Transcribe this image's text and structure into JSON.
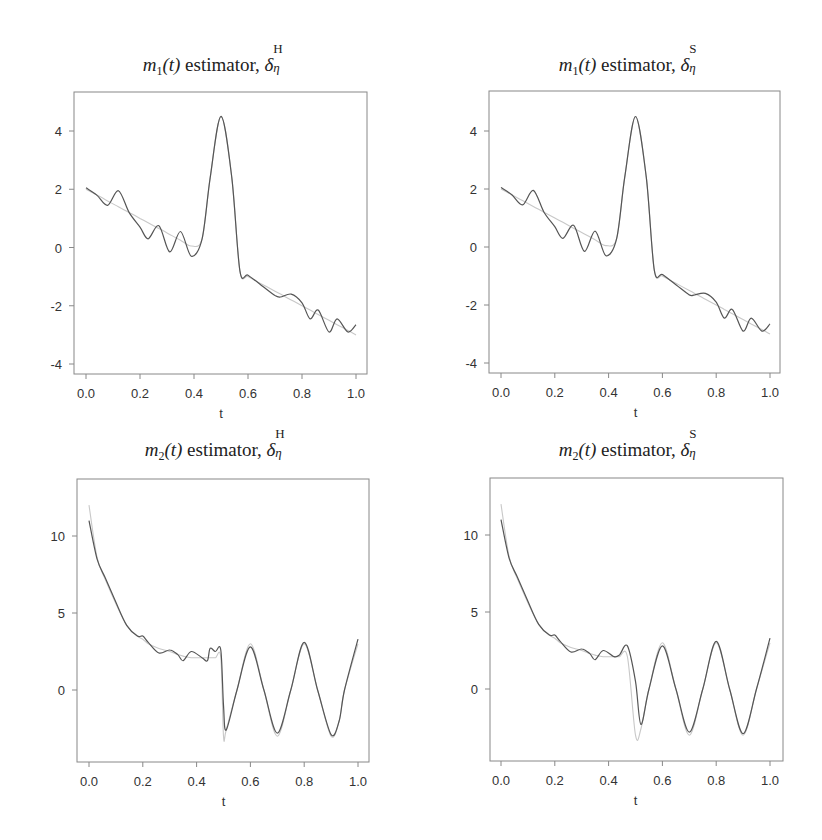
{
  "figure": {
    "panels": [
      {
        "id": "m1-H",
        "title_fn": "m",
        "title_sub": "1",
        "title_arg": "(t)",
        "title_text": " estimator, ",
        "title_delta": "δ",
        "title_sup": "H",
        "title_eta": "η",
        "xlabel": "t",
        "xticks": [
          "0.0",
          "0.2",
          "0.4",
          "0.6",
          "0.8",
          "1.0"
        ],
        "yticks": [
          "4",
          "2",
          "0",
          "-2",
          "-4"
        ]
      },
      {
        "id": "m1-S",
        "title_fn": "m",
        "title_sub": "1",
        "title_arg": "(t)",
        "title_text": " estimator, ",
        "title_delta": "δ",
        "title_sup": "S",
        "title_eta": "η",
        "xlabel": "t",
        "xticks": [
          "0.0",
          "0.2",
          "0.4",
          "0.6",
          "0.8",
          "1.0"
        ],
        "yticks": [
          "4",
          "2",
          "0",
          "-2",
          "-4"
        ]
      },
      {
        "id": "m2-H",
        "title_fn": "m",
        "title_sub": "2",
        "title_arg": "(t)",
        "title_text": " estimator, ",
        "title_delta": "δ",
        "title_sup": "H",
        "title_eta": "η",
        "xlabel": "t",
        "xticks": [
          "0.0",
          "0.2",
          "0.4",
          "0.6",
          "0.8",
          "1.0"
        ],
        "yticks": [
          "10",
          "5",
          "0"
        ]
      },
      {
        "id": "m2-S",
        "title_fn": "m",
        "title_sub": "2",
        "title_arg": "(t)",
        "title_text": " estimator, ",
        "title_delta": "δ",
        "title_sup": "S",
        "title_eta": "η",
        "xlabel": "t",
        "xticks": [
          "0.0",
          "0.2",
          "0.4",
          "0.6",
          "0.8",
          "1.0"
        ],
        "yticks": [
          "10",
          "5",
          "0"
        ]
      }
    ],
    "colors": {
      "estimate": "#555555",
      "truth": "#c8c8c8",
      "axis": "#888888"
    }
  },
  "chart_data": [
    {
      "type": "line",
      "title": "m1(t) estimator, δη^H",
      "xlabel": "t",
      "ylabel": "",
      "xlim": [
        0.0,
        1.0
      ],
      "ylim": [
        -4.3,
        5.3
      ],
      "x": [
        0.0,
        0.04,
        0.08,
        0.12,
        0.16,
        0.2,
        0.23,
        0.27,
        0.31,
        0.35,
        0.39,
        0.43,
        0.46,
        0.5,
        0.54,
        0.57,
        0.6,
        0.65,
        0.7,
        0.72,
        0.76,
        0.8,
        0.83,
        0.86,
        0.9,
        0.93,
        0.97,
        1.0
      ],
      "series": [
        {
          "name": "estimate",
          "values": [
            2.05,
            1.8,
            1.45,
            1.95,
            1.2,
            0.7,
            0.3,
            0.75,
            -0.15,
            0.55,
            -0.3,
            0.3,
            2.4,
            4.5,
            2.4,
            -0.8,
            -0.95,
            -1.3,
            -1.65,
            -1.7,
            -1.6,
            -1.9,
            -2.45,
            -2.15,
            -2.9,
            -2.45,
            -2.9,
            -2.65
          ]
        },
        {
          "name": "true",
          "values": [
            2.0,
            1.8,
            1.6,
            1.4,
            1.2,
            1.0,
            0.85,
            0.65,
            0.45,
            0.25,
            0.05,
            0.3,
            2.4,
            4.5,
            2.4,
            -0.8,
            -1.0,
            -1.25,
            -1.5,
            -1.6,
            -1.8,
            -2.0,
            -2.15,
            -2.3,
            -2.5,
            -2.65,
            -2.85,
            -3.0
          ]
        }
      ]
    },
    {
      "type": "line",
      "title": "m1(t) estimator, δη^S",
      "xlabel": "t",
      "ylabel": "",
      "xlim": [
        0.0,
        1.0
      ],
      "ylim": [
        -4.3,
        5.3
      ],
      "x": [
        0.0,
        0.04,
        0.08,
        0.12,
        0.16,
        0.2,
        0.23,
        0.27,
        0.31,
        0.35,
        0.39,
        0.43,
        0.46,
        0.5,
        0.54,
        0.57,
        0.6,
        0.65,
        0.7,
        0.72,
        0.76,
        0.8,
        0.83,
        0.86,
        0.9,
        0.93,
        0.97,
        1.0
      ],
      "series": [
        {
          "name": "estimate",
          "values": [
            2.05,
            1.8,
            1.45,
            1.95,
            1.2,
            0.7,
            0.3,
            0.75,
            -0.15,
            0.55,
            -0.3,
            0.3,
            2.4,
            4.5,
            2.4,
            -0.8,
            -0.95,
            -1.3,
            -1.65,
            -1.65,
            -1.6,
            -1.9,
            -2.45,
            -2.15,
            -2.9,
            -2.45,
            -2.9,
            -2.65
          ]
        },
        {
          "name": "true",
          "values": [
            2.0,
            1.8,
            1.6,
            1.4,
            1.2,
            1.0,
            0.85,
            0.65,
            0.45,
            0.25,
            0.05,
            0.3,
            2.4,
            4.5,
            2.4,
            -0.8,
            -1.0,
            -1.25,
            -1.5,
            -1.6,
            -1.8,
            -2.0,
            -2.15,
            -2.3,
            -2.5,
            -2.65,
            -2.85,
            -3.0
          ]
        }
      ]
    },
    {
      "type": "line",
      "title": "m2(t) estimator, δη^H",
      "xlabel": "t",
      "ylabel": "",
      "xlim": [
        0.0,
        1.0
      ],
      "ylim": [
        -4.7,
        13.7
      ],
      "x": [
        0.0,
        0.03,
        0.06,
        0.1,
        0.14,
        0.18,
        0.2,
        0.22,
        0.26,
        0.3,
        0.33,
        0.35,
        0.38,
        0.42,
        0.44,
        0.45,
        0.47,
        0.49,
        0.5,
        0.51,
        0.55,
        0.6,
        0.65,
        0.7,
        0.75,
        0.8,
        0.85,
        0.9,
        0.93,
        0.95,
        1.0
      ],
      "series": [
        {
          "name": "estimate",
          "values": [
            11.0,
            8.5,
            7.3,
            5.7,
            4.2,
            3.5,
            3.5,
            3.1,
            2.4,
            2.6,
            2.3,
            1.9,
            2.5,
            2.1,
            1.9,
            2.7,
            2.5,
            2.6,
            -1.0,
            -2.6,
            0.0,
            2.8,
            0.0,
            -2.8,
            0.0,
            3.1,
            0.0,
            -2.9,
            -2.0,
            0.0,
            3.3
          ]
        },
        {
          "name": "true",
          "values": [
            12.0,
            8.6,
            7.2,
            5.6,
            4.2,
            3.5,
            3.3,
            3.0,
            2.7,
            2.5,
            2.3,
            2.2,
            2.1,
            2.1,
            2.1,
            2.1,
            2.1,
            2.1,
            -3.0,
            -2.6,
            0.0,
            3.0,
            0.0,
            -3.0,
            0.0,
            3.0,
            0.0,
            -3.0,
            -2.0,
            0.0,
            3.0
          ]
        }
      ]
    },
    {
      "type": "line",
      "title": "m2(t) estimator, δη^S",
      "xlabel": "t",
      "ylabel": "",
      "xlim": [
        0.0,
        1.0
      ],
      "ylim": [
        -4.7,
        13.7
      ],
      "x": [
        0.0,
        0.03,
        0.06,
        0.1,
        0.14,
        0.18,
        0.2,
        0.22,
        0.26,
        0.3,
        0.33,
        0.35,
        0.38,
        0.42,
        0.44,
        0.47,
        0.5,
        0.52,
        0.55,
        0.6,
        0.65,
        0.7,
        0.75,
        0.8,
        0.85,
        0.9,
        0.95,
        1.0
      ],
      "series": [
        {
          "name": "estimate",
          "values": [
            11.0,
            8.5,
            7.3,
            5.7,
            4.2,
            3.5,
            3.5,
            3.1,
            2.4,
            2.6,
            2.3,
            1.9,
            2.5,
            2.1,
            2.2,
            2.8,
            0.5,
            -2.3,
            0.0,
            2.8,
            0.0,
            -2.8,
            0.0,
            3.1,
            0.0,
            -2.9,
            0.0,
            3.3
          ]
        },
        {
          "name": "true",
          "values": [
            12.0,
            8.6,
            7.2,
            5.6,
            4.2,
            3.5,
            3.3,
            3.0,
            2.7,
            2.5,
            2.3,
            2.2,
            2.1,
            2.1,
            2.1,
            2.1,
            -3.0,
            -2.6,
            0.0,
            3.0,
            0.0,
            -3.0,
            0.0,
            3.0,
            0.0,
            -3.0,
            0.0,
            3.0
          ]
        }
      ]
    }
  ]
}
